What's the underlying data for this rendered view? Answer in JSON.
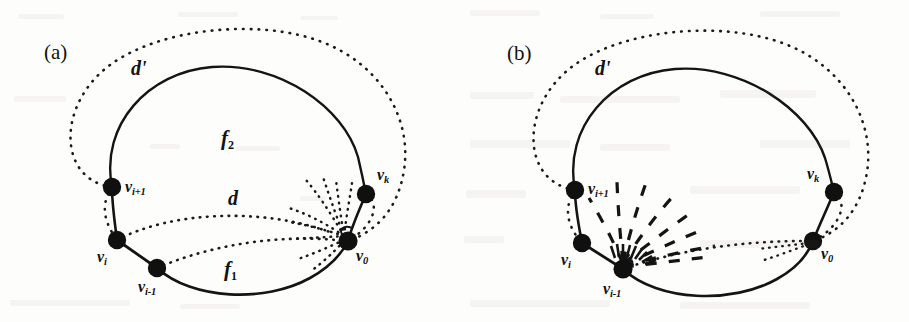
{
  "figure": {
    "type": "graph-theory-diagram",
    "background_color": "#fdfdfc",
    "ink_color": "#121212",
    "panels": [
      {
        "id": "a",
        "tag": "(a)",
        "outer_curve_label": "d'",
        "outer_curve_style": "dotted",
        "inner_curve_style": "solid",
        "region_labels": [
          {
            "name": "face-upper",
            "text": "f",
            "sub": "2"
          },
          {
            "name": "face-lower",
            "text": "f",
            "sub": "1"
          }
        ],
        "edge_label": "d",
        "fan_origin": "v0",
        "fan_style": "dotted",
        "vertices": [
          {
            "id": "vi_plus_1",
            "text": "v",
            "sub": "i+1",
            "label": "v i+1"
          },
          {
            "id": "vi",
            "text": "v",
            "sub": "i",
            "label": "v i"
          },
          {
            "id": "vi_minus_1",
            "text": "v",
            "sub": "i-1",
            "label": "v i-1"
          },
          {
            "id": "v0",
            "text": "v",
            "sub": "0",
            "label": "v 0"
          },
          {
            "id": "vk",
            "text": "v",
            "sub": "k",
            "label": "v k"
          }
        ]
      },
      {
        "id": "b",
        "tag": "(b)",
        "outer_curve_label": "d'",
        "outer_curve_style": "dotted",
        "inner_curve_style": "solid",
        "region_labels": [],
        "edge_label": "",
        "fan_origin": "vi_minus_1",
        "fan_style": "dashed",
        "vertices": [
          {
            "id": "vi_plus_1",
            "text": "v",
            "sub": "i+1",
            "label": "v i+1"
          },
          {
            "id": "vi",
            "text": "v",
            "sub": "i",
            "label": "v i"
          },
          {
            "id": "vi_minus_1",
            "text": "v",
            "sub": "i-1",
            "label": "v i-1"
          },
          {
            "id": "v0",
            "text": "v",
            "sub": "0",
            "label": "v 0"
          },
          {
            "id": "vk",
            "text": "v",
            "sub": "k",
            "label": "v k"
          }
        ]
      }
    ]
  },
  "labels": {
    "a": {
      "tag": "(a)",
      "dprime": "d'",
      "d": "d",
      "f2_base": "f",
      "f2_sub": "2",
      "f1_base": "f",
      "f1_sub": "1",
      "vi_plus_1_base": "v",
      "vi_plus_1_sub": "i+1",
      "vi_base": "v",
      "vi_sub": "i",
      "vi_minus_1_base": "v",
      "vi_minus_1_sub": "i-1",
      "v0_base": "v",
      "v0_sub": "0",
      "vk_base": "v",
      "vk_sub": "k"
    },
    "b": {
      "tag": "(b)",
      "dprime": "d'",
      "vi_plus_1_base": "v",
      "vi_plus_1_sub": "i+1",
      "vi_base": "v",
      "vi_sub": "i",
      "vi_minus_1_base": "v",
      "vi_minus_1_sub": "i-1",
      "v0_base": "v",
      "v0_sub": "0",
      "vk_base": "v",
      "vk_sub": "k"
    }
  }
}
